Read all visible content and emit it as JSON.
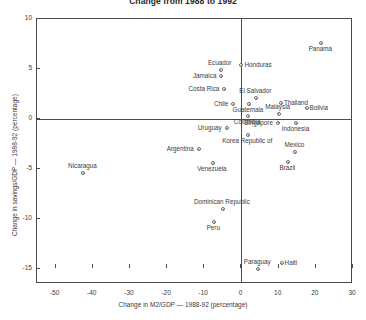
{
  "chart_data": {
    "type": "scatter",
    "title": "Change from 1988 to 1992",
    "xlabel": "Change in M2/GDP — 1988-92 (percentage)",
    "ylabel": "Change in savings/GDP — 1988-92 (percentage)",
    "xlim": [
      -55,
      30
    ],
    "ylim": [
      -16.5,
      10
    ],
    "xticks": [
      -50,
      -40,
      -30,
      -20,
      -10,
      0,
      10,
      20,
      30
    ],
    "xticklabels": [
      "-50",
      "-40",
      "-30",
      "-20",
      "-10",
      "0",
      "10",
      "20",
      "30"
    ],
    "yticks": [
      10,
      5,
      0,
      -5,
      -10,
      -15
    ],
    "yticklabels": [
      "10",
      "5",
      "0",
      "-5",
      "-10",
      "-15"
    ],
    "grid": false,
    "legend": null,
    "reference_lines": {
      "x": 0,
      "y": 0
    },
    "points": [
      {
        "label": "Panama",
        "x": 21.5,
        "y": 7.6,
        "label_pos": "below"
      },
      {
        "label": "Honduras",
        "x": 0.0,
        "y": 5.4,
        "label_pos": "right"
      },
      {
        "label": "Ecuador",
        "x": -5.6,
        "y": 4.9,
        "label_pos": "above"
      },
      {
        "label": "Jamaica",
        "x": -5.4,
        "y": 4.3,
        "label_pos": "left"
      },
      {
        "label": "Costa Rica",
        "x": -4.6,
        "y": 3.0,
        "label_pos": "left"
      },
      {
        "label": "El Salvador",
        "x": 4.0,
        "y": 2.1,
        "label_pos": "above"
      },
      {
        "label": "Thailand",
        "x": 10.6,
        "y": 1.6,
        "label_pos": "right"
      },
      {
        "label": "Chile",
        "x": -2.2,
        "y": 1.5,
        "label_pos": "left"
      },
      {
        "label": "Guatemala",
        "x": 2.0,
        "y": 1.5,
        "label_pos": "below"
      },
      {
        "label": "Bolivia",
        "x": 17.5,
        "y": 1.1,
        "label_pos": "right"
      },
      {
        "label": "Malaysia",
        "x": 10.0,
        "y": 0.55,
        "label_pos": "above"
      },
      {
        "label": "Colombia",
        "x": 1.8,
        "y": 0.3,
        "label_pos": "below"
      },
      {
        "label": "Singapore",
        "x": 9.8,
        "y": -0.35,
        "label_pos": "left"
      },
      {
        "label": "Indonesia",
        "x": 14.8,
        "y": -0.4,
        "label_pos": "below"
      },
      {
        "label": "Uruguay",
        "x": -4.0,
        "y": -0.9,
        "label_pos": "left"
      },
      {
        "label": "Korea Republic of",
        "x": 1.8,
        "y": -1.6,
        "label_pos": "below"
      },
      {
        "label": "Argentina",
        "x": -11.5,
        "y": -3.0,
        "label_pos": "left"
      },
      {
        "label": "Mexico",
        "x": 14.5,
        "y": -3.3,
        "label_pos": "above"
      },
      {
        "label": "Brazil",
        "x": 12.6,
        "y": -4.3,
        "label_pos": "below"
      },
      {
        "label": "Venezuela",
        "x": -7.7,
        "y": -4.4,
        "label_pos": "below"
      },
      {
        "label": "Nicaragua",
        "x": -42.5,
        "y": -5.4,
        "label_pos": "above"
      },
      {
        "label": "Dominican Republic",
        "x": -5.0,
        "y": -9.0,
        "label_pos": "above"
      },
      {
        "label": "Peru",
        "x": -7.3,
        "y": -10.3,
        "label_pos": "below"
      },
      {
        "label": "Haiti",
        "x": 10.8,
        "y": -14.4,
        "label_pos": "right"
      },
      {
        "label": "Paraguay",
        "x": 4.5,
        "y": -15.0,
        "label_pos": "above"
      }
    ]
  }
}
